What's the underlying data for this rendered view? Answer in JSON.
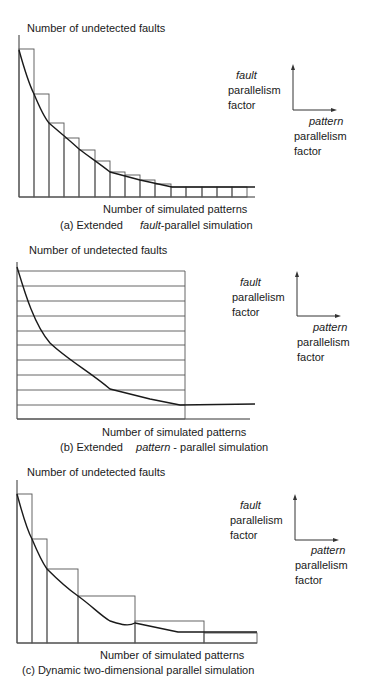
{
  "figure": {
    "panels": [
      {
        "id": "a",
        "y_axis_label": "Number of undetected faults",
        "x_axis_label": "Number of simulated patterns",
        "caption_prefix": "(a) Extended",
        "caption_italic": "fault",
        "caption_suffix": "-parallel simulation",
        "legend": {
          "vertical_italic": "fault",
          "vertical_line2": "parallelism",
          "vertical_line3": "factor",
          "horizontal_italic": "pattern",
          "horizontal_line2": "parallelism",
          "horizontal_line3": "factor"
        }
      },
      {
        "id": "b",
        "y_axis_label": "Number of undetected faults",
        "x_axis_label": "Number of simulated patterns",
        "caption_prefix": "(b)  Extended",
        "caption_italic": "pattern",
        "caption_suffix": " - parallel simulation",
        "legend": {
          "vertical_italic": "fault",
          "vertical_line2": "parallelism",
          "vertical_line3": "factor",
          "horizontal_italic": "pattern",
          "horizontal_line2": "parallelism",
          "horizontal_line3": "factor"
        }
      },
      {
        "id": "c",
        "y_axis_label": "Number of undetected faults",
        "x_axis_label": "Number of simulated patterns",
        "caption_prefix": "(c)  Dynamic two-dimensional parallel simulation",
        "caption_italic": "",
        "caption_suffix": "",
        "legend": {
          "vertical_italic": "fault",
          "vertical_line2": "parallelism",
          "vertical_line3": "factor",
          "horizontal_italic": "pattern",
          "horizontal_line2": "parallelism",
          "horizontal_line3": "factor"
        }
      }
    ]
  },
  "chart_data": [
    {
      "type": "bar",
      "title": "(a) Extended fault-parallel simulation",
      "xlabel": "Number of simulated patterns",
      "ylabel": "Number of undetected faults",
      "description": "Equal-width bars (fixed pattern parallelism = 1 per step, fault parallelism shrinking) overlaid with decreasing fault curve",
      "bar_widths_relative": [
        1,
        1,
        1,
        1,
        1,
        1,
        1,
        1,
        1,
        1,
        1,
        1,
        1,
        1,
        1
      ],
      "bar_heights_relative": [
        1.0,
        0.71,
        0.5,
        0.4,
        0.32,
        0.24,
        0.17,
        0.15,
        0.12,
        0.09,
        0.07,
        0.07,
        0.07,
        0.07,
        0.07
      ],
      "curve": "monotonically decreasing, flattening near zero",
      "grid": false
    },
    {
      "type": "bar",
      "title": "(b) Extended pattern-parallel simulation",
      "xlabel": "Number of simulated patterns",
      "ylabel": "Number of undetected faults",
      "description": "Equal-height horizontal strips spanning fixed pattern width, overlaid with decreasing fault curve",
      "strip_count": 10,
      "curve": "monotonically decreasing, flattening near zero",
      "grid": false
    },
    {
      "type": "bar",
      "title": "(c) Dynamic two-dimensional parallel simulation",
      "xlabel": "Number of simulated patterns",
      "ylabel": "Number of undetected faults",
      "description": "Bars with growing width and shrinking height that track the decreasing fault curve",
      "bar_widths_relative": [
        1,
        1,
        2,
        3.8,
        4.6,
        3.5
      ],
      "bar_heights_relative": [
        1.0,
        0.7,
        0.49,
        0.32,
        0.15,
        0.07
      ],
      "curve": "monotonically decreasing, flattening near zero",
      "grid": false
    }
  ],
  "geometry": {
    "a": {
      "axis": {
        "x0": 19,
        "y_top": 35,
        "y_base": 197,
        "x_end": 255
      },
      "bars": [
        [
          19,
          34,
          49
        ],
        [
          34,
          49,
          94
        ],
        [
          49,
          64,
          123
        ],
        [
          64,
          79,
          138
        ],
        [
          79,
          95,
          150
        ],
        [
          95,
          110,
          161
        ],
        [
          110,
          125,
          172
        ],
        [
          125,
          140,
          175
        ],
        [
          140,
          155,
          180
        ],
        [
          155,
          171,
          184
        ],
        [
          171,
          186,
          187
        ],
        [
          186,
          202,
          187
        ],
        [
          202,
          217,
          187
        ],
        [
          217,
          232,
          187
        ],
        [
          232,
          247,
          187
        ]
      ],
      "curve": "M19,50 C24,68 28,82 34,94 C39,106 44,117 49,123 C58,131 66,137 79,149 C88,156 100,164 110,172 L140,180 L172,187 L255,187",
      "y_label_pos": [
        27,
        32
      ],
      "x_label_pos": [
        103,
        213
      ],
      "caption_pos": [
        60,
        229
      ],
      "legend": {
        "fault_x": 236,
        "fault_y": 79,
        "corner": [
          293,
          110
        ],
        "up_tip": 65,
        "right_tip": 336,
        "pattern_x": 309,
        "pattern_y": 125,
        "plab_x": 294
      }
    },
    "b": {
      "axis": {
        "x0": 17,
        "y_top": 262,
        "y_base": 419,
        "x_end": 250
      },
      "rect": {
        "x0": 17,
        "x1": 185
      },
      "lines": [
        271,
        286,
        301,
        316,
        331,
        345,
        360,
        375,
        390,
        405,
        419
      ],
      "curve": "M17,267 C24,290 34,325 50,343 C68,360 90,372 110,389 L150,399 L180,405 L255,404",
      "y_label_pos": [
        29,
        254
      ],
      "x_label_pos": [
        102,
        436
      ],
      "caption_pos": [
        60,
        451
      ],
      "legend": {
        "fault_x": 240,
        "fault_y": 286,
        "corner": [
          297,
          316
        ],
        "up_tip": 272,
        "right_tip": 340,
        "pattern_x": 313,
        "pattern_y": 331,
        "plab_x": 297
      }
    },
    "c": {
      "axis": {
        "x0": 17,
        "y_top": 480,
        "y_base": 643,
        "x_end": 257
      },
      "bars": [
        [
          17,
          32,
          494
        ],
        [
          32,
          47,
          539
        ],
        [
          47,
          78,
          569
        ],
        [
          78,
          135,
          596
        ],
        [
          135,
          204,
          621
        ],
        [
          204,
          257,
          633
        ]
      ],
      "curve": "M17,494 C22,512 26,528 32,539 C37,551 42,562 47,569 C58,580 68,589 78,596 C92,606 100,615 110,621 C120,624 128,627 135,623 L178,632 L257,632",
      "y_label_pos": [
        27,
        476
      ],
      "x_label_pos": [
        100,
        659
      ],
      "caption_pos": [
        22,
        674
      ],
      "legend": {
        "fault_x": 240,
        "fault_y": 509,
        "corner": [
          295,
          540
        ],
        "up_tip": 495,
        "right_tip": 338,
        "pattern_x": 311,
        "pattern_y": 554,
        "plab_x": 295
      }
    }
  }
}
